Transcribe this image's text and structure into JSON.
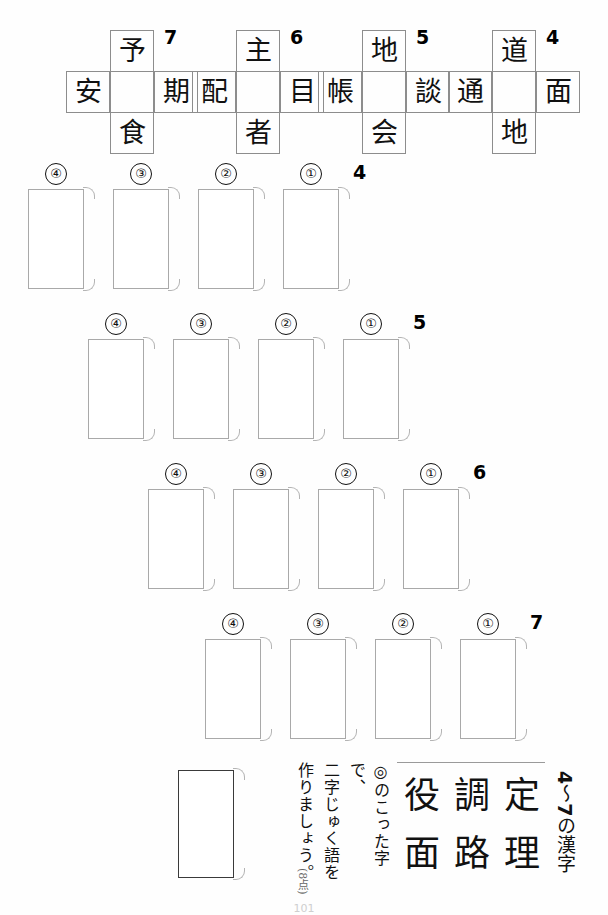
{
  "worksheet": {
    "page_number": "101",
    "points_label": "(8点)"
  },
  "cross_puzzles": [
    {
      "number": "7",
      "top": "予",
      "left": "安",
      "center": "",
      "right": "期",
      "bottom": "食"
    },
    {
      "number": "6",
      "top": "主",
      "left": "配",
      "center": "",
      "right": "目",
      "bottom": "者"
    },
    {
      "number": "5",
      "top": "地",
      "left": "帳",
      "center": "",
      "right": "談",
      "bottom": "会"
    },
    {
      "number": "4",
      "top": "道",
      "left": "通",
      "center": "",
      "right": "面",
      "bottom": "地"
    }
  ],
  "answer_rows": [
    {
      "number": "4",
      "boxes": [
        {
          "marker": "④",
          "value": ""
        },
        {
          "marker": "③",
          "value": ""
        },
        {
          "marker": "②",
          "value": ""
        },
        {
          "marker": "①",
          "value": ""
        }
      ]
    },
    {
      "number": "5",
      "boxes": [
        {
          "marker": "④",
          "value": ""
        },
        {
          "marker": "③",
          "value": ""
        },
        {
          "marker": "②",
          "value": ""
        },
        {
          "marker": "①",
          "value": ""
        }
      ]
    },
    {
      "number": "6",
      "boxes": [
        {
          "marker": "④",
          "value": ""
        },
        {
          "marker": "③",
          "value": ""
        },
        {
          "marker": "②",
          "value": ""
        },
        {
          "marker": "①",
          "value": ""
        }
      ]
    },
    {
      "number": "7",
      "boxes": [
        {
          "marker": "④",
          "value": ""
        },
        {
          "marker": "③",
          "value": ""
        },
        {
          "marker": "②",
          "value": ""
        },
        {
          "marker": "①",
          "value": ""
        }
      ]
    }
  ],
  "kanji_pool": {
    "heading_prefix": "4",
    "heading_tilde": "〜",
    "heading_suffix": "7",
    "heading_tail": "の漢字",
    "characters": [
      "役",
      "調",
      "定",
      "面",
      "路",
      "理"
    ]
  },
  "instruction": {
    "line1": "◎のこった字で、",
    "line2": "二字じゅく語を",
    "line3": "作りましょう。"
  },
  "final_answer_box": {
    "value": ""
  }
}
